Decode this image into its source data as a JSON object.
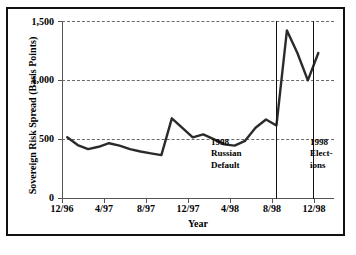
{
  "chart_data": {
    "type": "line",
    "title": "",
    "xlabel": "Year",
    "ylabel": "Sovereign Risk Spread (Basis Points)",
    "ylim": [
      0,
      1500
    ],
    "yticks": [
      0,
      500,
      1000,
      1500
    ],
    "ytick_labels": [
      "0",
      "500",
      "1,000",
      "1,500"
    ],
    "xtick_labels": [
      "12/96",
      "4/97",
      "8/97",
      "12/97",
      "4/98",
      "8/98",
      "12/98"
    ],
    "xtick_months": [
      0,
      4,
      8,
      12,
      16,
      20,
      24
    ],
    "xlim_months": [
      -0.5,
      25.5
    ],
    "grid": "horizontal-dashed",
    "legend": "none",
    "series": [
      {
        "name": "Sovereign Risk Spread",
        "x_months": [
          0,
          1,
          2,
          3,
          4,
          5,
          6,
          7,
          8,
          9,
          10,
          11,
          12,
          13,
          14,
          15,
          16,
          17,
          18,
          19,
          20,
          21,
          22,
          23,
          24
        ],
        "x_labels": [
          "12/96",
          "1/97",
          "2/97",
          "3/97",
          "4/97",
          "5/97",
          "6/97",
          "7/97",
          "8/97",
          "9/97",
          "10/97",
          "11/97",
          "12/97",
          "1/98",
          "2/98",
          "3/98",
          "4/98",
          "5/98",
          "6/98",
          "7/98",
          "8/98",
          "9/98",
          "10/98",
          "11/98",
          "12/98"
        ],
        "values": [
          520,
          455,
          420,
          440,
          470,
          450,
          420,
          400,
          385,
          370,
          680,
          600,
          520,
          545,
          505,
          460,
          450,
          490,
          600,
          670,
          620,
          1420,
          1230,
          1000,
          1230
        ]
      }
    ],
    "annotations": [
      {
        "id": "russian-default",
        "lines": [
          "1998",
          "Russian",
          "Default"
        ],
        "x_month": 20,
        "type": "vertical-line-with-label"
      },
      {
        "id": "elections",
        "lines": [
          "1998",
          "Elect-",
          "ions"
        ],
        "x_month": 23.5,
        "type": "vertical-line-with-label"
      }
    ]
  },
  "axis": {
    "y_title": "Sovereign Risk Spread (Basis Points)",
    "x_title": "Year",
    "y_labels": [
      "1,500",
      "1,000",
      "500",
      "0"
    ],
    "x_labels": [
      "12/96",
      "4/97",
      "8/97",
      "12/97",
      "4/98",
      "8/98",
      "12/98"
    ]
  },
  "annotations": {
    "russian_default": {
      "line1": "1998",
      "line2": "Russian",
      "line3": "Default"
    },
    "elections": {
      "line1": "1998",
      "line2": "Elect-",
      "line3": "ions"
    }
  },
  "colors": {
    "line": "#2b2b2b",
    "grid": "#6a6a6a",
    "axis": "#555555",
    "frame": "#111111",
    "background": "#ffffff"
  }
}
